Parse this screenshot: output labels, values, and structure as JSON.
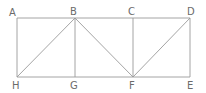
{
  "diagram": {
    "type": "geometry-figure",
    "points": {
      "A": {
        "x": 17,
        "y": 18
      },
      "B": {
        "x": 75,
        "y": 18
      },
      "C": {
        "x": 133,
        "y": 18
      },
      "D": {
        "x": 190,
        "y": 18
      },
      "E": {
        "x": 190,
        "y": 77
      },
      "F": {
        "x": 133,
        "y": 77
      },
      "G": {
        "x": 75,
        "y": 77
      },
      "H": {
        "x": 17,
        "y": 77
      }
    },
    "labels": [
      {
        "id": "A",
        "text": "A",
        "x": 9,
        "y": 16
      },
      {
        "id": "B",
        "text": "B",
        "x": 70,
        "y": 15
      },
      {
        "id": "C",
        "text": "C",
        "x": 128,
        "y": 15
      },
      {
        "id": "D",
        "text": "D",
        "x": 187,
        "y": 15
      },
      {
        "id": "H",
        "text": "H",
        "x": 12,
        "y": 89
      },
      {
        "id": "G",
        "text": "G",
        "x": 70,
        "y": 89
      },
      {
        "id": "F",
        "text": "F",
        "x": 129,
        "y": 89
      },
      {
        "id": "E",
        "text": "E",
        "x": 187,
        "y": 89
      }
    ],
    "segments": [
      [
        "A",
        "D"
      ],
      [
        "H",
        "E"
      ],
      [
        "A",
        "H"
      ],
      [
        "D",
        "E"
      ],
      [
        "B",
        "G"
      ],
      [
        "C",
        "F"
      ],
      [
        "H",
        "B"
      ],
      [
        "B",
        "F"
      ],
      [
        "F",
        "D"
      ]
    ],
    "colors": {
      "line": "#9a9a9a",
      "label": "#6b6b6b"
    }
  }
}
